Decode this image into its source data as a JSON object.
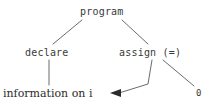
{
  "diagram": {
    "type": "parse-tree",
    "background_color": "#ffffff",
    "edge_color": "#6b6b6b",
    "node_text_color": "#3a3a3a",
    "nodes": [
      {
        "id": "program",
        "label": "program",
        "font": "mono"
      },
      {
        "id": "declare",
        "label": "declare",
        "font": "mono"
      },
      {
        "id": "assign",
        "label": "assign (=)",
        "font": "mono"
      },
      {
        "id": "info",
        "label": "information on i",
        "font": "serif"
      },
      {
        "id": "zero",
        "label": "0",
        "font": "mono"
      }
    ],
    "edges": [
      {
        "from": "program",
        "to": "declare",
        "style": "line"
      },
      {
        "from": "program",
        "to": "assign",
        "style": "line"
      },
      {
        "from": "declare",
        "to": "info",
        "style": "line"
      },
      {
        "from": "assign",
        "to": "zero",
        "style": "line"
      },
      {
        "from": "assign",
        "to": "info",
        "style": "arrow"
      }
    ]
  }
}
